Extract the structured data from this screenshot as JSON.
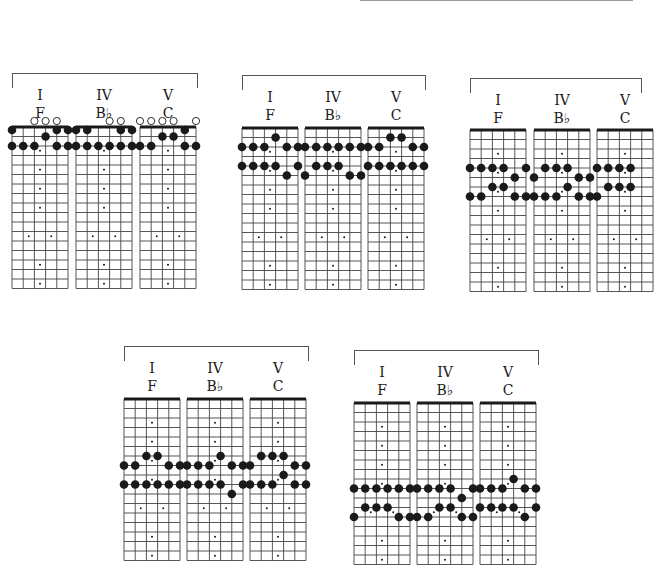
{
  "fretboard": {
    "strings": 6,
    "frets": 17,
    "inlay_single": [
      3,
      5,
      7,
      9,
      15,
      17
    ],
    "inlay_double": [
      12
    ]
  },
  "groups": [
    {
      "id": "g1",
      "x": 12,
      "y": 73,
      "width": 184,
      "board_top": 127,
      "position_label": "open",
      "chords": [
        {
          "numeral": "I",
          "name": "F",
          "dx": 0,
          "open": [
            3,
            4,
            5
          ],
          "dots": [
            [
              1,
              0
            ],
            [
              5,
              0
            ],
            [
              6,
              0
            ],
            [
              4,
              1
            ],
            [
              1,
              2
            ],
            [
              2,
              2
            ],
            [
              3,
              2
            ],
            [
              5,
              2
            ],
            [
              6,
              2
            ]
          ]
        },
        {
          "numeral": "IV",
          "name": "B♭",
          "dx": 64,
          "open": [
            4,
            5
          ],
          "dots": [
            [
              1,
              0
            ],
            [
              2,
              0
            ],
            [
              5,
              0
            ],
            [
              6,
              0
            ],
            [
              1,
              2
            ],
            [
              2,
              2
            ],
            [
              3,
              2
            ],
            [
              4,
              2
            ],
            [
              5,
              2
            ],
            [
              6,
              2
            ]
          ]
        },
        {
          "numeral": "V",
          "name": "C",
          "dx": 128,
          "open": [
            1,
            2,
            3,
            4,
            6
          ],
          "dots": [
            [
              5,
              0
            ],
            [
              3,
              1
            ],
            [
              4,
              1
            ],
            [
              1,
              2
            ],
            [
              2,
              2
            ],
            [
              5,
              2
            ],
            [
              6,
              2
            ]
          ]
        }
      ]
    },
    {
      "id": "g2",
      "x": 242,
      "y": 75,
      "width": 182,
      "board_top": 128,
      "chords": [
        {
          "numeral": "I",
          "name": "F",
          "dx": 0,
          "open": [],
          "dots": [
            [
              4,
              1
            ],
            [
              1,
              2
            ],
            [
              2,
              2
            ],
            [
              3,
              2
            ],
            [
              5,
              2
            ],
            [
              6,
              2
            ],
            [
              1,
              4
            ],
            [
              2,
              4
            ],
            [
              3,
              4
            ],
            [
              4,
              4
            ],
            [
              6,
              4
            ],
            [
              5,
              5
            ]
          ]
        },
        {
          "numeral": "IV",
          "name": "B♭",
          "dx": 63,
          "open": [],
          "dots": [
            [
              1,
              2
            ],
            [
              2,
              2
            ],
            [
              3,
              2
            ],
            [
              4,
              2
            ],
            [
              5,
              2
            ],
            [
              6,
              2
            ],
            [
              2,
              4
            ],
            [
              3,
              4
            ],
            [
              4,
              4
            ],
            [
              1,
              5
            ],
            [
              5,
              5
            ],
            [
              6,
              5
            ]
          ]
        },
        {
          "numeral": "V",
          "name": "C",
          "dx": 126,
          "open": [],
          "dots": [
            [
              3,
              1
            ],
            [
              4,
              1
            ],
            [
              1,
              2
            ],
            [
              2,
              2
            ],
            [
              5,
              2
            ],
            [
              6,
              2
            ],
            [
              1,
              4
            ],
            [
              2,
              4
            ],
            [
              3,
              4
            ],
            [
              4,
              4
            ],
            [
              5,
              4
            ],
            [
              6,
              4
            ]
          ]
        }
      ]
    },
    {
      "id": "g3",
      "x": 470,
      "y": 78,
      "width": 170,
      "board_top": 130,
      "chords": [
        {
          "numeral": "I",
          "name": "F",
          "dx": 0,
          "open": [],
          "dots": [
            [
              1,
              4
            ],
            [
              2,
              4
            ],
            [
              3,
              4
            ],
            [
              4,
              4
            ],
            [
              6,
              4
            ],
            [
              5,
              5
            ],
            [
              3,
              6
            ],
            [
              4,
              6
            ],
            [
              1,
              7
            ],
            [
              2,
              7
            ],
            [
              5,
              7
            ],
            [
              6,
              7
            ]
          ]
        },
        {
          "numeral": "IV",
          "name": "B♭",
          "dx": 64,
          "open": [],
          "dots": [
            [
              2,
              4
            ],
            [
              3,
              4
            ],
            [
              4,
              4
            ],
            [
              1,
              5
            ],
            [
              5,
              5
            ],
            [
              6,
              5
            ],
            [
              4,
              6
            ],
            [
              1,
              7
            ],
            [
              2,
              7
            ],
            [
              3,
              7
            ],
            [
              5,
              7
            ],
            [
              6,
              7
            ]
          ]
        },
        {
          "numeral": "V",
          "name": "C",
          "dx": 127,
          "open": [],
          "dots": [
            [
              1,
              4
            ],
            [
              2,
              4
            ],
            [
              3,
              4
            ],
            [
              4,
              4
            ],
            [
              2,
              6
            ],
            [
              3,
              6
            ],
            [
              4,
              6
            ],
            [
              1,
              7
            ]
          ]
        }
      ]
    },
    {
      "id": "g4",
      "x": 124,
      "y": 346,
      "width": 183,
      "board_top": 399,
      "chords": [
        {
          "numeral": "I",
          "name": "F",
          "dx": 0,
          "open": [],
          "dots": [
            [
              3,
              6
            ],
            [
              4,
              6
            ],
            [
              1,
              7
            ],
            [
              2,
              7
            ],
            [
              5,
              7
            ],
            [
              6,
              7
            ],
            [
              1,
              9
            ],
            [
              2,
              9
            ],
            [
              3,
              9
            ],
            [
              4,
              9
            ],
            [
              5,
              9
            ],
            [
              6,
              9
            ]
          ]
        },
        {
          "numeral": "IV",
          "name": "B♭",
          "dx": 63,
          "open": [],
          "dots": [
            [
              4,
              6
            ],
            [
              1,
              7
            ],
            [
              2,
              7
            ],
            [
              3,
              7
            ],
            [
              5,
              7
            ],
            [
              6,
              7
            ],
            [
              1,
              9
            ],
            [
              2,
              9
            ],
            [
              3,
              9
            ],
            [
              4,
              9
            ],
            [
              6,
              9
            ],
            [
              5,
              10
            ]
          ]
        },
        {
          "numeral": "V",
          "name": "C",
          "dx": 126,
          "open": [],
          "dots": [
            [
              2,
              6
            ],
            [
              3,
              6
            ],
            [
              4,
              6
            ],
            [
              1,
              7
            ],
            [
              5,
              7
            ],
            [
              6,
              7
            ],
            [
              4,
              8
            ],
            [
              1,
              9
            ],
            [
              2,
              9
            ],
            [
              3,
              9
            ],
            [
              5,
              9
            ],
            [
              6,
              9
            ]
          ]
        }
      ]
    },
    {
      "id": "g5",
      "x": 354,
      "y": 350,
      "width": 183,
      "board_top": 403,
      "chords": [
        {
          "numeral": "I",
          "name": "F",
          "dx": 0,
          "open": [],
          "dots": [
            [
              1,
              9
            ],
            [
              2,
              9
            ],
            [
              3,
              9
            ],
            [
              4,
              9
            ],
            [
              5,
              9
            ],
            [
              6,
              9
            ],
            [
              2,
              11
            ],
            [
              3,
              11
            ],
            [
              4,
              11
            ],
            [
              1,
              12
            ],
            [
              5,
              12
            ],
            [
              6,
              12
            ]
          ]
        },
        {
          "numeral": "IV",
          "name": "B♭",
          "dx": 63,
          "open": [],
          "dots": [
            [
              1,
              9
            ],
            [
              2,
              9
            ],
            [
              3,
              9
            ],
            [
              4,
              9
            ],
            [
              6,
              9
            ],
            [
              5,
              10
            ],
            [
              3,
              11
            ],
            [
              4,
              11
            ],
            [
              1,
              12
            ],
            [
              2,
              12
            ],
            [
              5,
              12
            ],
            [
              6,
              12
            ]
          ]
        },
        {
          "numeral": "V",
          "name": "C",
          "dx": 126,
          "open": [],
          "dots": [
            [
              4,
              8
            ],
            [
              1,
              9
            ],
            [
              2,
              9
            ],
            [
              3,
              9
            ],
            [
              5,
              9
            ],
            [
              6,
              9
            ],
            [
              1,
              11
            ],
            [
              2,
              11
            ],
            [
              3,
              11
            ],
            [
              4,
              11
            ],
            [
              6,
              11
            ],
            [
              5,
              12
            ]
          ]
        }
      ]
    }
  ],
  "colors": {
    "ink": "#1a1a1a",
    "grid": "#444444",
    "bracket": "#555555",
    "paper": "#ffffff"
  }
}
